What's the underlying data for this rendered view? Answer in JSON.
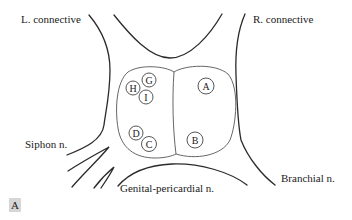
{
  "figure": {
    "panel_label": "A",
    "nerve_labels": {
      "left_connective": "L. connective",
      "right_connective": "R. connective",
      "siphon": "Siphon n.",
      "genital_pericardial": "Genital-pericardial n.",
      "branchial": "Branchial n."
    },
    "left_hemiganglion_cells": [
      {
        "id": "H",
        "label": "H"
      },
      {
        "id": "G",
        "label": "G"
      },
      {
        "id": "I",
        "label": "I"
      },
      {
        "id": "D",
        "label": "D"
      },
      {
        "id": "C",
        "label": "C"
      }
    ],
    "right_hemiganglion_cells": [
      {
        "id": "A",
        "label": "A"
      },
      {
        "id": "B",
        "label": "B"
      }
    ],
    "colors": {
      "line": "#2a2a2a",
      "background": "#ffffff",
      "badge": "#d6d6d6"
    }
  }
}
